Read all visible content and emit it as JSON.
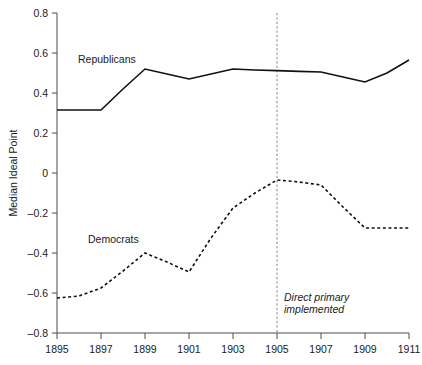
{
  "chart_data": {
    "type": "line",
    "title": "",
    "xlabel": "",
    "ylabel": "Median Ideal Point",
    "xlim": [
      1895,
      1911
    ],
    "ylim": [
      -0.8,
      0.8
    ],
    "grid": false,
    "legend_position": "inline-labels",
    "xticks": [
      "1895",
      "1897",
      "1899",
      "1901",
      "1903",
      "1905",
      "1907",
      "1909",
      "1911"
    ],
    "xtick_values": [
      1895,
      1897,
      1899,
      1901,
      1903,
      1905,
      1907,
      1909,
      1911
    ],
    "yticks": [
      "0.8",
      "0.6",
      "0.4",
      "0.2",
      "0",
      "–0.2",
      "–0.4",
      "–0.6",
      "–0.8"
    ],
    "ytick_values": [
      0.8,
      0.6,
      0.4,
      0.2,
      0,
      -0.2,
      -0.4,
      -0.6,
      -0.8
    ],
    "x": [
      1895,
      1896,
      1897,
      1898,
      1899,
      1900,
      1901,
      1902,
      1903,
      1904,
      1905,
      1906,
      1907,
      1908,
      1909,
      1910,
      1911
    ],
    "series": [
      {
        "name": "Republicans",
        "style": "solid",
        "color": "#111111",
        "label_text": "Republicans",
        "values": [
          0.315,
          0.315,
          0.315,
          0.42,
          0.52,
          0.495,
          0.47,
          0.495,
          0.52,
          0.515,
          0.512,
          0.508,
          0.505,
          0.48,
          0.455,
          0.5,
          0.565
        ]
      },
      {
        "name": "Democrats",
        "style": "dashed",
        "color": "#111111",
        "label_text": "Democrats",
        "values": [
          -0.625,
          -0.615,
          -0.575,
          -0.49,
          -0.4,
          -0.445,
          -0.495,
          -0.325,
          -0.175,
          -0.1,
          -0.035,
          -0.045,
          -0.06,
          -0.17,
          -0.275,
          -0.275,
          -0.275
        ]
      }
    ],
    "annotations": [
      {
        "name": "direct-primary-marker",
        "type": "vertical-line",
        "x_value": 1905,
        "text_line1": "Direct primary",
        "text_line2": "implemented"
      }
    ]
  }
}
